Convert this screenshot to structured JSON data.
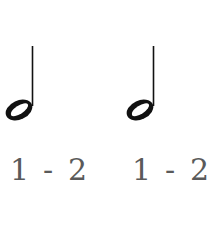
{
  "figure": {
    "notes": [
      {
        "type": "half-note",
        "count": {
          "beat1": "1",
          "sep": "-",
          "beat2": "2"
        }
      },
      {
        "type": "half-note",
        "count": {
          "beat1": "1",
          "sep": "-",
          "beat2": "2"
        }
      }
    ],
    "colors": {
      "note": "#111111",
      "count_text": "#5a5a5a",
      "background": "#ffffff"
    }
  }
}
